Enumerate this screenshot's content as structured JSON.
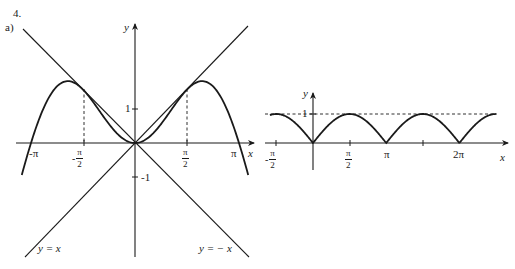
{
  "header": {
    "problem_number": "4.",
    "part_label": "a)"
  },
  "chart_data": [
    {
      "type": "line",
      "title": "",
      "xlabel": "x",
      "ylabel": "y",
      "xlim": [
        -3.42,
        3.42
      ],
      "ylim": [
        -3.4,
        3.5
      ],
      "grid": false,
      "legend": "none (inline annotations)",
      "series": [
        {
          "name": "y = x sin x",
          "expression": "x*sin(x)",
          "domain": [
            -3.42,
            3.42
          ],
          "style": "solid-thick"
        },
        {
          "name": "y = x",
          "expression": "x",
          "domain": [
            -3.3,
            3.4
          ],
          "style": "solid"
        },
        {
          "name": "y = -x",
          "expression": "-x",
          "domain": [
            -3.4,
            3.3
          ],
          "style": "solid"
        }
      ],
      "reference_lines": [
        {
          "type": "vertical-dashed",
          "x": -1.5708,
          "from_y": 0,
          "to_y": 1.5708
        },
        {
          "type": "vertical-dashed",
          "x": 1.5708,
          "from_y": 0,
          "to_y": 1.5708
        }
      ],
      "x_ticks": [
        {
          "value": -3.1416,
          "label": "-π"
        },
        {
          "value": -1.5708,
          "label_num": "π",
          "label_den": "2",
          "sign": "-"
        },
        {
          "value": 1.5708,
          "label_num": "π",
          "label_den": "2",
          "sign": ""
        },
        {
          "value": 3.1416,
          "label": "π"
        }
      ],
      "y_ticks": [
        {
          "value": 1,
          "label": "1"
        },
        {
          "value": -1,
          "label": "-1"
        }
      ],
      "annotations": [
        {
          "text": "y = x",
          "near": [
            -2.9,
            -3.2
          ]
        },
        {
          "text": "y = − x",
          "near": [
            2.0,
            -3.2
          ]
        }
      ]
    },
    {
      "type": "line",
      "title": "",
      "xlabel": "x",
      "ylabel": "y",
      "xlim": [
        -1.8,
        8.1
      ],
      "ylim": [
        -0.95,
        1.65
      ],
      "grid": false,
      "series": [
        {
          "name": "y = |sin x|",
          "expression": "abs(sin(x))",
          "domain": [
            -1.85,
            7.85
          ],
          "style": "solid-thick"
        }
      ],
      "reference_lines": [
        {
          "type": "horizontal-dashed",
          "y": 1,
          "from_x": -1.85,
          "to_x": 7.85
        }
      ],
      "x_ticks": [
        {
          "value": -1.5708,
          "label_num": "π",
          "label_den": "2",
          "sign": "-"
        },
        {
          "value": 1.5708,
          "label_num": "π",
          "label_den": "2",
          "sign": ""
        },
        {
          "value": 3.1416,
          "label": "π"
        },
        {
          "value": 4.7124,
          "label": ""
        },
        {
          "value": 6.2832,
          "label": "2π"
        }
      ],
      "y_ticks": [
        {
          "value": 1,
          "label": "1"
        }
      ]
    }
  ],
  "left": {
    "y_label": "y",
    "x_label": "x",
    "tick_neg_pi": "-π",
    "tick_pi": "π",
    "half_num": "π",
    "half_den": "2",
    "neg_sign": "-",
    "y_one": "1",
    "y_neg_one": "-1",
    "ann_yx": "y = x",
    "ann_ynx": "y = − x"
  },
  "right": {
    "y_label": "y",
    "x_label": "x",
    "y_one": "1",
    "tick_pi": "π",
    "tick_2pi": "2π",
    "half_num": "π",
    "half_den": "2",
    "neg_sign": "-"
  }
}
